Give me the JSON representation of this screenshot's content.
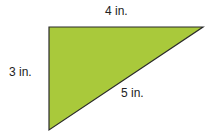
{
  "diagram": {
    "shape": "right-triangle",
    "fill_color": "#a9c93b",
    "stroke_color": "#2b2b2b",
    "vertices": {
      "right_angle": [
        49,
        27
      ],
      "top_right": [
        203,
        27
      ],
      "bottom": [
        49,
        130
      ]
    },
    "sides": {
      "top": {
        "label": "4 in.",
        "length": 4
      },
      "left": {
        "label": "3 in.",
        "length": 3
      },
      "hypotenuse": {
        "label": "5 in.",
        "length": 5
      }
    }
  }
}
